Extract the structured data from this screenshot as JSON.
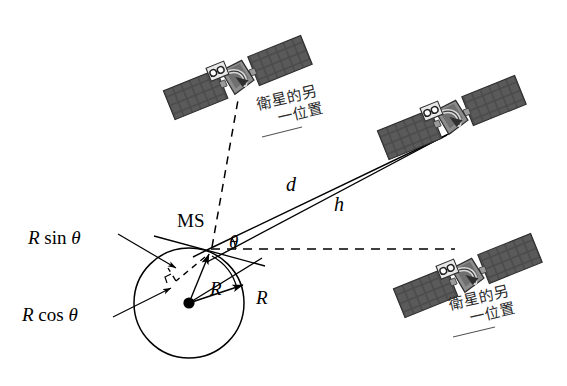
{
  "diagram": {
    "background_color": "#ffffff",
    "line_color": "#000000",
    "satellite_panel_color": "#4a4a4a",
    "satellite_body_color": "#8c8c8c",
    "cjk_text_color": "#2b2b2b"
  },
  "labels": {
    "ms": "MS",
    "theta": "θ",
    "d": "d",
    "h": "h",
    "radius_1": "R",
    "radius_2": "R",
    "r_sin_theta_prefix": "R",
    "r_sin_theta_func": "sin",
    "r_sin_theta_arg": "θ",
    "r_cos_theta_prefix": "R",
    "r_cos_theta_func": "cos",
    "r_cos_theta_arg": "θ"
  },
  "annotations": {
    "satellite_top_caption_line1": "衛星的另",
    "satellite_top_caption_line2": "一位置",
    "satellite_bottom_caption_line1": "衛星的另",
    "satellite_bottom_caption_line2": "一位置"
  },
  "geometry": {
    "earth_center_x": 189,
    "earth_center_y": 303,
    "earth_radius": 55,
    "ms_x": 211,
    "ms_y": 248,
    "satellite_top_x": 238,
    "satellite_top_y": 78,
    "satellite_main_x": 452,
    "satellite_main_y": 118,
    "satellite_lower_x": 468,
    "satellite_lower_y": 276
  },
  "icons": {
    "satellite": "satellite-icon",
    "earth": "earth-circle-icon"
  }
}
